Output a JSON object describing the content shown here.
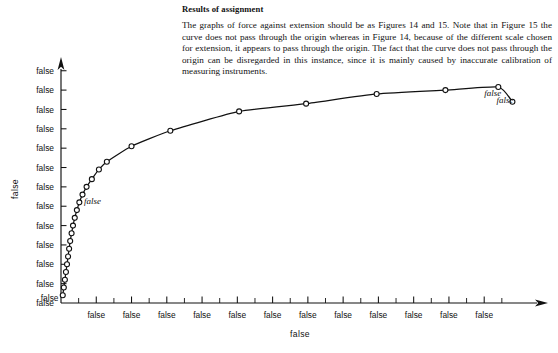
{
  "document": {
    "heading": "Results of assignment",
    "paragraph": "The graphs of force against extension should be as Figures 14 and 15. Note that in Figure 15 the curve does not pass through the origin whereas in Figure 14, because of the different scale chosen for extension, it appears to pass through the origin. The fact that the curve does not pass through the origin can be disregarded in this instance, since it is mainly caused by inaccurate calibration of measuring instruments."
  },
  "chart_data": {
    "type": "line",
    "title": "",
    "xlabel": "extension  (mm)",
    "ylabel": "axial tensile force (kN)",
    "xlim": [
      0,
      2.62
    ],
    "ylim": [
      0,
      62
    ],
    "grid": false,
    "legend": null,
    "origin_label": "0",
    "x_ticks": [
      0.2,
      0.4,
      0.6,
      0.8,
      1.0,
      1.2,
      1.4,
      1.6,
      1.8,
      2.0,
      2.2,
      2.4
    ],
    "x_tick_labels": [
      "0·2",
      "0·4",
      "0·6",
      "0·8",
      "1·0",
      "1·2",
      "1·4",
      "1·6",
      "1·8",
      "2·0",
      "2·2",
      "2·4"
    ],
    "x_minor_ticks": [
      0.1,
      0.3,
      0.5,
      0.7,
      0.9,
      1.1,
      1.3,
      1.5,
      1.7,
      1.9,
      2.1,
      2.3,
      2.5
    ],
    "y_ticks": [
      0,
      5,
      10,
      15,
      20,
      25,
      30,
      35,
      40,
      45,
      50,
      55,
      60
    ],
    "y_tick_labels": [
      "0",
      "5",
      "10",
      "15",
      "25",
      "20",
      "30",
      "35",
      "40",
      "45",
      "50",
      "55",
      "60"
    ],
    "y_tick_label_note": "As printed in the source, the labels at the 20 kN and 25 kN gridlines are transposed.",
    "marker": "open-circle",
    "series": [
      {
        "name": "axial tensile force vs extension",
        "points": [
          [
            0.01,
            2.0
          ],
          [
            0.016,
            4.0
          ],
          [
            0.022,
            6.0
          ],
          [
            0.028,
            8.0
          ],
          [
            0.034,
            10.0
          ],
          [
            0.04,
            12.0
          ],
          [
            0.046,
            14.0
          ],
          [
            0.052,
            16.0
          ],
          [
            0.06,
            18.0
          ],
          [
            0.068,
            20.0
          ],
          [
            0.078,
            22.0
          ],
          [
            0.09,
            24.0
          ],
          [
            0.104,
            26.0
          ],
          [
            0.122,
            28.0
          ],
          [
            0.145,
            30.0
          ],
          [
            0.175,
            32.0
          ],
          [
            0.215,
            34.5
          ],
          [
            0.26,
            36.5
          ],
          [
            0.4,
            40.5
          ],
          [
            0.62,
            44.5
          ],
          [
            1.01,
            49.5
          ],
          [
            1.39,
            51.5
          ],
          [
            1.79,
            54.0
          ],
          [
            2.18,
            55.0
          ],
          [
            2.48,
            55.8
          ],
          [
            2.56,
            52.0
          ]
        ]
      }
    ],
    "annotations": [
      {
        "label": "A",
        "x": 0.13,
        "y": 25.5
      },
      {
        "label": "B",
        "x": 2.4,
        "y": 53.6
      },
      {
        "label": "C",
        "x": 2.47,
        "y": 51.6
      }
    ]
  }
}
